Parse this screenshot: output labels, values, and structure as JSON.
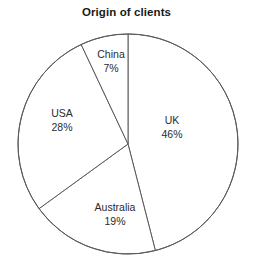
{
  "chart_data": {
    "type": "pie",
    "title": "Origin of clients",
    "xlabel": "",
    "ylabel": "",
    "units": "percent",
    "start_angle_deg": 0,
    "direction": "clockwise",
    "legend": "none",
    "grid": false,
    "categories": [
      "UK",
      "Australia",
      "USA",
      "China"
    ],
    "values": [
      46,
      19,
      28,
      7
    ],
    "slices": [
      {
        "label": "UK",
        "value": 46,
        "value_label": "46%",
        "start_deg": 0,
        "end_deg": 165.6,
        "fill": "#ffffff",
        "stroke": "#5a5a5a",
        "label_x": 172,
        "label_y": 127
      },
      {
        "label": "Australia",
        "value": 19,
        "value_label": "19%",
        "start_deg": 165.6,
        "end_deg": 234.0,
        "fill": "#ffffff",
        "stroke": "#5a5a5a",
        "label_x": 115,
        "label_y": 214
      },
      {
        "label": "USA",
        "value": 28,
        "value_label": "28%",
        "start_deg": 234.0,
        "end_deg": 334.8,
        "fill": "#ffffff",
        "stroke": "#5a5a5a",
        "label_x": 62,
        "label_y": 120
      },
      {
        "label": "China",
        "value": 7,
        "value_label": "7%",
        "start_deg": 334.8,
        "end_deg": 360.0,
        "fill": "#ffffff",
        "stroke": "#5a5a5a",
        "label_x": 111,
        "label_y": 61
      }
    ],
    "geometry": {
      "center_x": 128,
      "center_y": 144,
      "radius": 110
    },
    "colors": {
      "background": "#ffffff",
      "outline": "#5a5a5a",
      "title_text": "#1a1a1a",
      "label_text": "#2b2b2b"
    }
  }
}
